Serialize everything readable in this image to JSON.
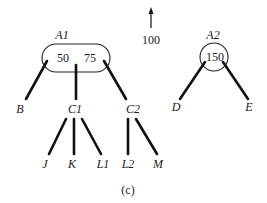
{
  "caption": "(c)",
  "arrow": {
    "label": "100"
  },
  "nodes": {
    "A1": {
      "label": "A1",
      "keys": [
        "50",
        "75"
      ]
    },
    "A2": {
      "label": "A2",
      "keys": [
        "150"
      ]
    },
    "B": {
      "label": "B"
    },
    "C1": {
      "label": "C1"
    },
    "C2": {
      "label": "C2"
    },
    "D": {
      "label": "D"
    },
    "E": {
      "label": "E"
    },
    "J": {
      "label": "J"
    },
    "K": {
      "label": "K"
    },
    "L1": {
      "label": "L1"
    },
    "L2": {
      "label": "L2"
    },
    "M": {
      "label": "M"
    }
  },
  "edges": [
    [
      "A1",
      "B"
    ],
    [
      "A1",
      "C1"
    ],
    [
      "A1",
      "C2"
    ],
    [
      "C1",
      "J"
    ],
    [
      "C1",
      "K"
    ],
    [
      "C1",
      "L1"
    ],
    [
      "C2",
      "L2"
    ],
    [
      "C2",
      "M"
    ],
    [
      "A2",
      "D"
    ],
    [
      "A2",
      "E"
    ]
  ]
}
